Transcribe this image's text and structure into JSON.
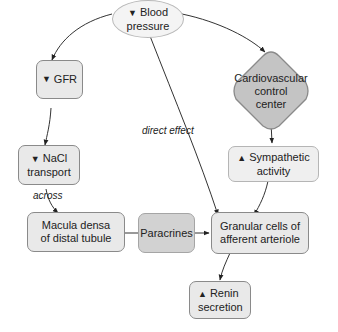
{
  "nodes": {
    "blood_pressure": {
      "arrow": "▼",
      "line1": "Blood",
      "line2": "pressure"
    },
    "gfr": {
      "arrow": "▼",
      "text": "GFR"
    },
    "nacl": {
      "arrow": "▼",
      "line1": "NaCl",
      "line2": "transport"
    },
    "macula": {
      "line1": "Macula densa",
      "line2": "of distal tubule"
    },
    "paracrines": {
      "text": "Paracrines"
    },
    "granular": {
      "line1": "Granular cells of",
      "line2": "afferent arteriole"
    },
    "renin": {
      "arrow": "▲",
      "line1": "Renin",
      "line2": "secretion"
    },
    "cardio": {
      "line1": "Cardiovascular",
      "line2": "control",
      "line3": "center"
    },
    "sympathetic": {
      "arrow": "▲",
      "line1": "Sympathetic",
      "line2": "activity"
    }
  },
  "edge_labels": {
    "across": "across",
    "direct_effect": "direct effect"
  },
  "colors": {
    "light_box": "#e9e9e9",
    "mid_box": "#d2d2d2",
    "diamond": "#c4c4c4",
    "border": "#8a8a8a"
  }
}
